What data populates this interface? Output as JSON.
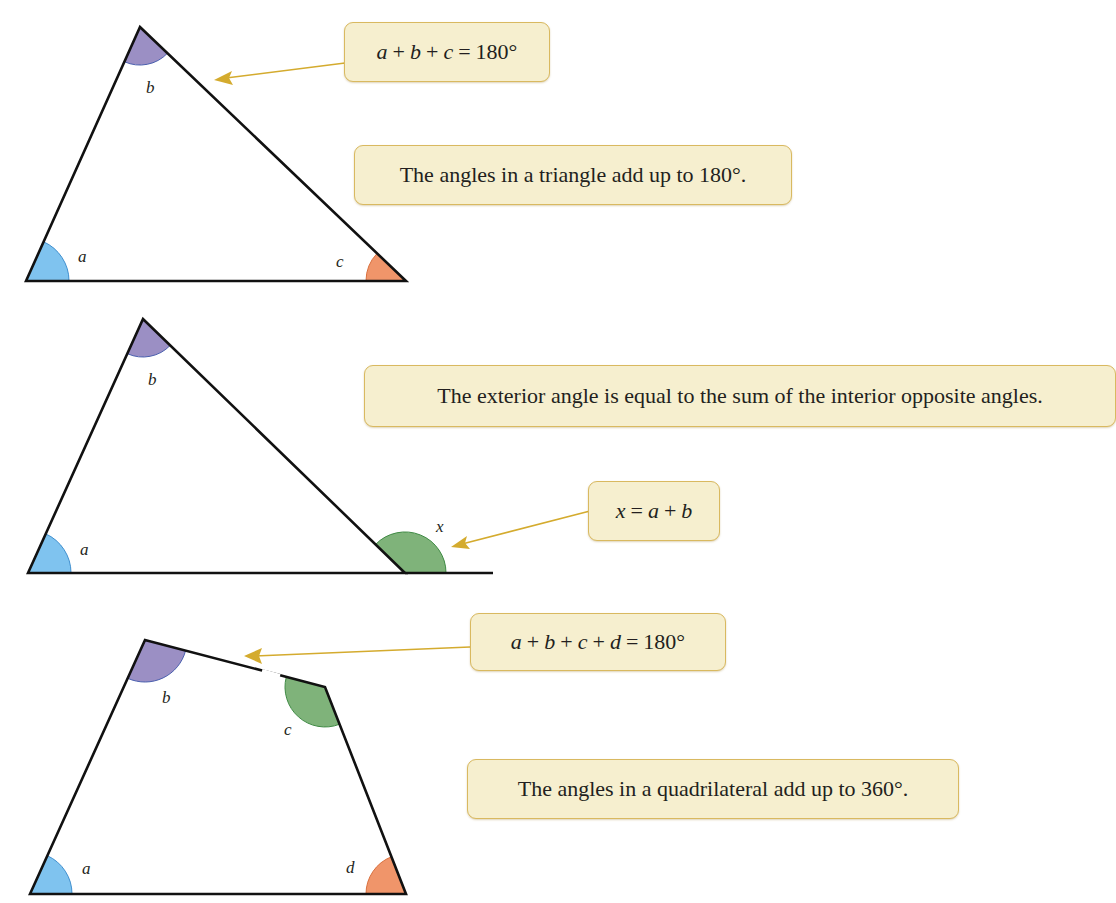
{
  "colors": {
    "angle_a": "#7fc3ef",
    "angle_b": "#9b8fc4",
    "angle_c_triangle": "#f0956a",
    "angle_x": "#7fb37a",
    "angle_c_quad": "#7fb37a",
    "angle_d": "#f0956a",
    "callout_fill": "#f6efcf",
    "callout_border": "#d9b960",
    "pointer": "#d4ab2e",
    "edge": "#111111"
  },
  "panels": [
    {
      "shape": "triangle",
      "labels": {
        "a": "a",
        "b": "b",
        "c": "c"
      },
      "formula": {
        "vars": [
          "a",
          "b",
          "c"
        ],
        "ops": [
          "+",
          "+",
          "="
        ],
        "value": "180°"
      },
      "statement": "The angles in a triangle add up to 180°."
    },
    {
      "shape": "triangle-exterior",
      "labels": {
        "a": "a",
        "b": "b",
        "x": "x"
      },
      "formula": {
        "lhs": "x",
        "eq": "=",
        "vars": [
          "a",
          "b"
        ],
        "op": "+"
      },
      "statement": "The exterior angle is equal to the sum of the interior opposite angles."
    },
    {
      "shape": "quadrilateral",
      "labels": {
        "a": "a",
        "b": "b",
        "c": "c",
        "d": "d"
      },
      "formula": {
        "vars": [
          "a",
          "b",
          "c",
          "d"
        ],
        "ops": [
          "+",
          "+",
          "+",
          "="
        ],
        "value": "180°"
      },
      "statement": "The angles in a quadrilateral add up to 360°."
    }
  ]
}
